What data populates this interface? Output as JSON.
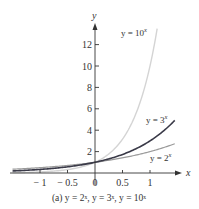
{
  "chart_data": {
    "type": "line",
    "title": "",
    "caption": "(a) y = 2ˣ, y = 3ˣ, y = 10ˣ",
    "xlabel": "x",
    "ylabel": "y",
    "xlim": [
      -1.5,
      1.5
    ],
    "ylim": [
      0,
      14
    ],
    "grid": false,
    "x_ticks": [
      -1,
      -0.5,
      0,
      0.5,
      1
    ],
    "x_tick_labels": [
      "− 1",
      "− 0.5",
      "0",
      "0.5",
      "1"
    ],
    "y_ticks": [
      2,
      4,
      6,
      8,
      10,
      12
    ],
    "y_tick_labels": [
      "2",
      "4",
      "6",
      "8",
      "10",
      "12"
    ],
    "series": [
      {
        "name": "y = 2ˣ",
        "label_base": "y = 2",
        "label_exp": "x",
        "color": "#9a9a9a",
        "width": 1.2,
        "base": 2,
        "x_range": [
          -1.5,
          1.45
        ]
      },
      {
        "name": "y = 3ˣ",
        "label_base": "y = 3",
        "label_exp": "x",
        "color": "#3a3a48",
        "width": 1.6,
        "base": 3,
        "x_range": [
          -1.5,
          1.45
        ]
      },
      {
        "name": "y = 10ˣ",
        "label_base": "y = 10",
        "label_exp": "x",
        "color": "#d4d4d4",
        "width": 1.4,
        "base": 10,
        "x_range": [
          -1.5,
          1.13
        ]
      }
    ]
  }
}
